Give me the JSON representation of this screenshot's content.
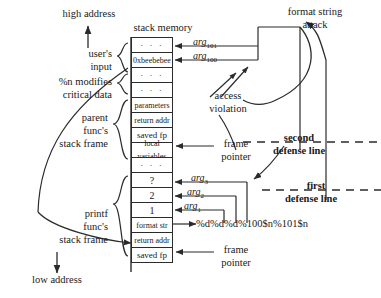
{
  "axis": {
    "high_address": "high address",
    "low_address": "low address"
  },
  "headers": {
    "stack_memory": "stack memory",
    "format_string_attack_line1": "format string",
    "format_string_attack_line2": "attack"
  },
  "left_labels": {
    "users_input_line1": "user's",
    "users_input_line2": "input",
    "n_modifies_line1": "%n modifies",
    "n_modifies_line2": "critical data",
    "parent_frame_line1": "parent",
    "parent_frame_line2": "func's",
    "parent_frame_line3": "stack frame",
    "printf_frame_line1": "printf",
    "printf_frame_line2": "func's",
    "printf_frame_line3": "stack frame"
  },
  "stack_cells": [
    {
      "id": "cell-dots-1",
      "text": "· · ·",
      "kind": "dots"
    },
    {
      "id": "cell-beebebee",
      "text": "0xbeebebee",
      "kind": "value"
    },
    {
      "id": "cell-dots-2",
      "text": "· · ·",
      "kind": "dots"
    },
    {
      "id": "cell-dots-3",
      "text": "· · ·",
      "kind": "dots"
    },
    {
      "id": "cell-parameters",
      "text": "parameters",
      "kind": "value"
    },
    {
      "id": "cell-return-addr-1",
      "text": "return addr",
      "kind": "value"
    },
    {
      "id": "cell-saved-fp-1",
      "text": "saved fp",
      "kind": "value"
    },
    {
      "id": "cell-local-vars",
      "text": "local variables",
      "kind": "value"
    },
    {
      "id": "cell-dots-4",
      "text": "· · ·",
      "kind": "dots"
    },
    {
      "id": "cell-question",
      "text": "?",
      "kind": "value"
    },
    {
      "id": "cell-two",
      "text": "2",
      "kind": "value"
    },
    {
      "id": "cell-one",
      "text": "1",
      "kind": "value"
    },
    {
      "id": "cell-format-str",
      "text": "format str",
      "kind": "value"
    },
    {
      "id": "cell-return-addr-2",
      "text": "return addr",
      "kind": "value"
    },
    {
      "id": "cell-saved-fp-2",
      "text": "saved fp",
      "kind": "value"
    }
  ],
  "arg_labels": [
    {
      "id": "arg-101",
      "base": "arg",
      "sub": "101"
    },
    {
      "id": "arg-100",
      "base": "arg",
      "sub": "100"
    },
    {
      "id": "arg-3",
      "base": "arg",
      "sub": "3"
    },
    {
      "id": "arg-2",
      "base": "arg",
      "sub": "2"
    },
    {
      "id": "arg-1",
      "base": "arg",
      "sub": "1"
    }
  ],
  "annotations": {
    "access_violation_line1": "access",
    "access_violation_line2": "violation",
    "frame_pointer_top_line1": "frame",
    "frame_pointer_top_line2": "pointer",
    "frame_pointer_bottom_line1": "frame",
    "frame_pointer_bottom_line2": "pointer",
    "second_defense_line1": "second",
    "second_defense_line2": "defense line",
    "first_defense_line1": "first",
    "first_defense_line2": "defense line",
    "format_string_payload": "%d%d%d%100$n%101$n"
  },
  "colors": {
    "ink": "#1a1a1a",
    "line": "#2b2b2b",
    "background": "#ffffff"
  }
}
